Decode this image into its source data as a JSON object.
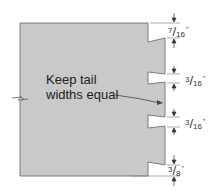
{
  "diagram": {
    "type": "dovetail-layout",
    "annotation": "Keep tail widths equal",
    "annotation_lines": [
      "Keep tail",
      "widths equal"
    ],
    "colors": {
      "board": "#c9c9c9",
      "outline": "#555555",
      "text": "#222222"
    },
    "dimensions": [
      {
        "id": "top",
        "numerator": "7",
        "denominator": "16",
        "unit": "\""
      },
      {
        "id": "notch1",
        "numerator": "3",
        "denominator": "16",
        "unit": "\""
      },
      {
        "id": "notch2",
        "numerator": "3",
        "denominator": "16",
        "unit": "\""
      },
      {
        "id": "bottom",
        "numerator": "3",
        "denominator": "8",
        "unit": "\""
      }
    ]
  }
}
